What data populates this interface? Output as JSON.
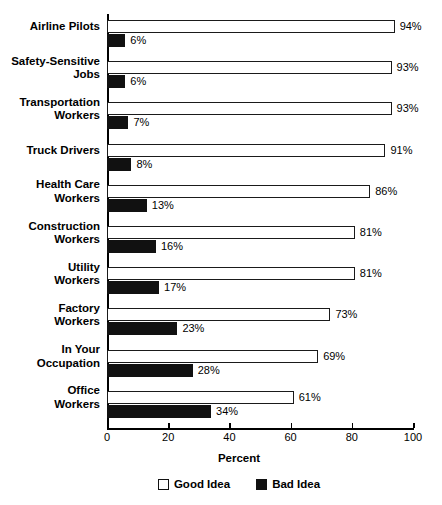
{
  "chart_data": {
    "type": "bar",
    "orientation": "horizontal",
    "title": "",
    "xlabel": "Percent",
    "ylabel": "",
    "xlim": [
      0,
      100
    ],
    "xticks": [
      0,
      20,
      40,
      60,
      80,
      100
    ],
    "xtick_labels": [
      "0",
      "20",
      "40",
      "60",
      "80",
      "100"
    ],
    "grid": false,
    "legend_position": "bottom",
    "categories": [
      "Airline Pilots",
      "Safety-Sensitive Jobs",
      "Transportation Workers",
      "Truck Drivers",
      "Health Care Workers",
      "Construction Workers",
      "Utility Workers",
      "Factory Workers",
      "In Your Occupation",
      "Office Workers"
    ],
    "series": [
      {
        "name": "Good Idea",
        "color": "#ffffff",
        "values": [
          94,
          93,
          93,
          91,
          86,
          81,
          81,
          73,
          69,
          61
        ],
        "labels": [
          "94%",
          "93%",
          "93%",
          "91%",
          "86%",
          "81%",
          "81%",
          "73%",
          "69%",
          "61%"
        ]
      },
      {
        "name": "Bad Idea",
        "color": "#111111",
        "values": [
          6,
          6,
          7,
          8,
          13,
          16,
          17,
          23,
          28,
          34
        ],
        "labels": [
          "6%",
          "6%",
          "7%",
          "8%",
          "13%",
          "16%",
          "17%",
          "23%",
          "28%",
          "34%"
        ]
      }
    ],
    "category_label_lines": [
      [
        "Airline Pilots"
      ],
      [
        "Safety-Sensitive",
        "Jobs"
      ],
      [
        "Transportation",
        "Workers"
      ],
      [
        "Truck Drivers"
      ],
      [
        "Health Care",
        "Workers"
      ],
      [
        "Construction",
        "Workers"
      ],
      [
        "Utility",
        "Workers"
      ],
      [
        "Factory",
        "Workers"
      ],
      [
        "In Your",
        "Occupation"
      ],
      [
        "Office",
        "Workers"
      ]
    ],
    "legend": [
      {
        "label": "Good Idea",
        "swatch": "good"
      },
      {
        "label": "Bad Idea",
        "swatch": "bad"
      }
    ]
  }
}
